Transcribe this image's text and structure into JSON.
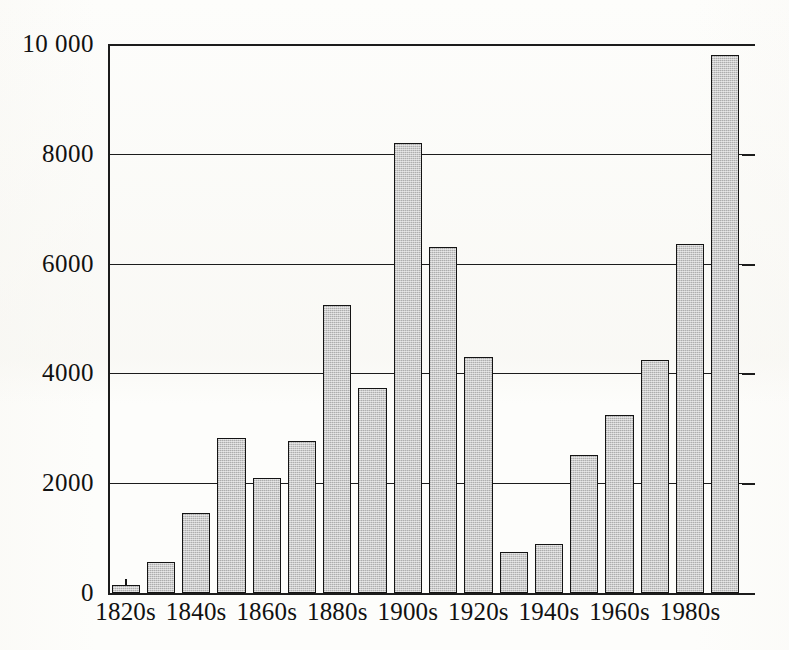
{
  "chart_data": {
    "type": "bar",
    "title": "",
    "subtitle": "",
    "xlabel": "",
    "ylabel": "",
    "grid": true,
    "legend": null,
    "ylim": [
      0,
      10000
    ],
    "ytick_step": 2000,
    "ytick_labels": [
      "10 000",
      "8000",
      "6000",
      "4000",
      "2000",
      "0"
    ],
    "ytick_values": [
      10000,
      8000,
      6000,
      4000,
      2000,
      0
    ],
    "categories": [
      "1820s",
      "1830s",
      "1840s",
      "1850s",
      "1860s",
      "1870s",
      "1880s",
      "1890s",
      "1900s",
      "1910s",
      "1920s",
      "1930s",
      "1940s",
      "1950s",
      "1960s",
      "1970s",
      "1980s",
      "1990s"
    ],
    "values": [
      150,
      560,
      1450,
      2820,
      2100,
      2760,
      5250,
      3740,
      8200,
      6310,
      4300,
      750,
      900,
      2520,
      3250,
      4240,
      6350,
      9800
    ],
    "xtick_labels": [
      "1820s",
      "1840s",
      "1860s",
      "1880s",
      "1900s",
      "1920s",
      "1940s",
      "1960s",
      "1980s"
    ],
    "xtick_category_indices": [
      0,
      2,
      4,
      6,
      8,
      10,
      12,
      14,
      16
    ],
    "colors": {
      "bar_fill": "#cacaca",
      "bar_edge": "#141414",
      "axis": "#1c1c1c",
      "text": "#111111",
      "background": "#fdfdfb"
    }
  }
}
